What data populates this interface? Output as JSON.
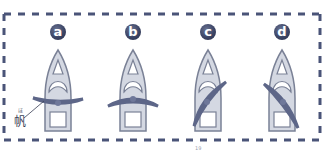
{
  "diagram": {
    "type": "sail-position-comparison",
    "frame_style": "dashed-border",
    "colors": {
      "frame": "#4a5478",
      "badge": "#3c4566",
      "hull_fill": "#d4d8e2",
      "hull_stroke": "#7a8196",
      "sail": "#5d6688",
      "background": "#ffffff"
    },
    "panels": [
      {
        "label": "a",
        "sail": "straight across, slightly curved forward",
        "angle": 0
      },
      {
        "label": "b",
        "sail": "straight across, curved backward",
        "angle": 0
      },
      {
        "label": "c",
        "sail": "diagonal, from lower-left to upper-right",
        "angle": -50
      },
      {
        "label": "d",
        "sail": "diagonal, from upper-left to lower-right",
        "angle": 50
      }
    ],
    "annotation": {
      "text": "帆",
      "ruby": "ほ"
    },
    "page_number": "19"
  }
}
